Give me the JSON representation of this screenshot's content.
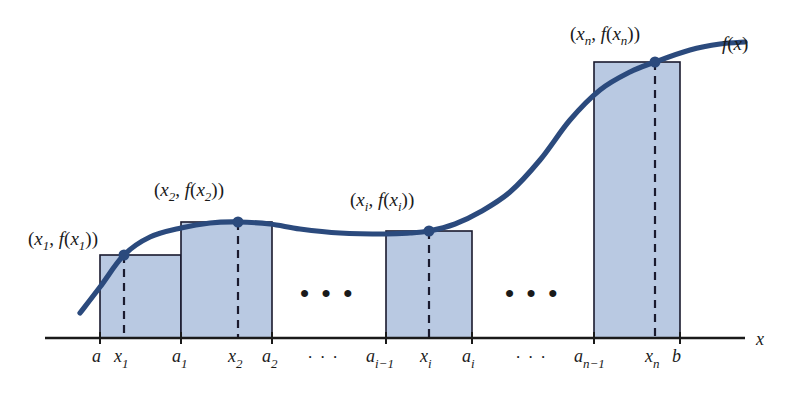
{
  "figure": {
    "colors": {
      "rect_fill": "#b9c9e2",
      "rect_stroke": "#1a1a2e",
      "curve": "#2b4a7d",
      "axis": "#1a1a1a",
      "dash": "#1a1a2e",
      "text": "#1a1a1a"
    }
  },
  "curve": {
    "label": "f(x)",
    "label_base": "f",
    "label_paren_open": "(",
    "label_var": "x",
    "label_paren_close": ")"
  },
  "axis": {
    "x_label": "x",
    "y_baseline": 338,
    "x_start": 45,
    "x_end": 745
  },
  "point_labels": [
    {
      "id": "p1",
      "text": "(x_1, f(x_1))",
      "open": "(",
      "var": "x",
      "sub": "1",
      "comma": ", ",
      "fn": "f",
      "x": 28,
      "y": 245
    },
    {
      "id": "p2",
      "text": "(x_2, f(x_2))",
      "open": "(",
      "var": "x",
      "sub": "2",
      "comma": ", ",
      "fn": "f",
      "x": 154,
      "y": 196
    },
    {
      "id": "pi",
      "text": "(x_i, f(x_i))",
      "open": "(",
      "var": "x",
      "sub": "i",
      "comma": ", ",
      "fn": "f",
      "x": 350,
      "y": 206
    },
    {
      "id": "pn",
      "text": "(x_n, f(x_n))",
      "open": "(",
      "var": "x",
      "sub": "n",
      "comma": ", ",
      "fn": "f",
      "x": 570,
      "y": 40
    }
  ],
  "axis_ticks": [
    {
      "id": "a",
      "main": "a",
      "sub": "",
      "x": 100,
      "label_x": 96,
      "label_y": 360
    },
    {
      "id": "x1",
      "main": "x",
      "sub": "1",
      "x": 124,
      "label_x": 118,
      "label_y": 360
    },
    {
      "id": "a1",
      "main": "a",
      "sub": "1",
      "x": 181,
      "label_x": 175,
      "label_y": 360
    },
    {
      "id": "x2",
      "main": "x",
      "sub": "2",
      "x": 238,
      "label_x": 232,
      "label_y": 360
    },
    {
      "id": "a2",
      "main": "a",
      "sub": "2",
      "x": 272,
      "label_x": 266,
      "label_y": 360
    },
    {
      "id": "ai-1",
      "main": "a",
      "sub": "i−1",
      "x": 386,
      "label_x": 370,
      "label_y": 360
    },
    {
      "id": "xi",
      "main": "x",
      "sub": "i",
      "x": 429,
      "label_x": 424,
      "label_y": 360
    },
    {
      "id": "ai",
      "main": "a",
      "sub": "i",
      "x": 472,
      "label_x": 466,
      "label_y": 360
    },
    {
      "id": "an-1",
      "main": "a",
      "sub": "n−1",
      "x": 594,
      "label_x": 578,
      "label_y": 360
    },
    {
      "id": "xn",
      "main": "x",
      "sub": "n",
      "x": 655,
      "label_x": 650,
      "label_y": 360
    },
    {
      "id": "b",
      "main": "b",
      "sub": "",
      "x": 680,
      "label_x": 676,
      "label_y": 360
    }
  ],
  "axis_ellipses": [
    {
      "id": "axis-ellipsis-left",
      "text": "...",
      "x": 312,
      "y": 358
    },
    {
      "id": "axis-ellipsis-right",
      "text": "...",
      "x": 520,
      "y": 358
    }
  ],
  "gap_ellipses": [
    {
      "id": "gap-ellipsis-left",
      "text": "• • •",
      "x": 303,
      "y": 302
    },
    {
      "id": "gap-ellipsis-right",
      "text": "• • •",
      "x": 508,
      "y": 302
    }
  ],
  "rectangles": [
    {
      "id": "rect-1",
      "left": 100,
      "right": 181,
      "top": 255,
      "bottom": 338,
      "midline_x": 124,
      "dot_x": 124,
      "dot_y": 255
    },
    {
      "id": "rect-2",
      "left": 181,
      "right": 272,
      "top": 222,
      "bottom": 338,
      "midline_x": 238,
      "dot_x": 238,
      "dot_y": 222
    },
    {
      "id": "rect-i",
      "left": 386,
      "right": 472,
      "top": 231,
      "bottom": 338,
      "midline_x": 429,
      "dot_x": 429,
      "dot_y": 231
    },
    {
      "id": "rect-n",
      "left": 594,
      "right": 680,
      "top": 62,
      "bottom": 338,
      "midline_x": 655,
      "dot_x": 655,
      "dot_y": 62
    }
  ],
  "chart_data": {
    "type": "area",
    "xlabel": "x",
    "ylabel": "",
    "categories": [
      "[a, a_1]",
      "[a_1, a_2]",
      "[a_{i-1}, a_i]",
      "[a_{n-1}, b]"
    ],
    "sample_points": [
      "x_1",
      "x_2",
      "x_i",
      "x_n"
    ],
    "rect_heights_px": [
      83,
      116,
      107,
      276
    ],
    "rect_left_px": [
      100,
      181,
      386,
      594
    ],
    "rect_right_px": [
      181,
      272,
      472,
      680
    ],
    "baseline_px": 338,
    "curve_points": [
      [
        80,
        313
      ],
      [
        100,
        287
      ],
      [
        124,
        255
      ],
      [
        150,
        237
      ],
      [
        181,
        228
      ],
      [
        210,
        223
      ],
      [
        238,
        222
      ],
      [
        270,
        224
      ],
      [
        300,
        229
      ],
      [
        340,
        233
      ],
      [
        386,
        234
      ],
      [
        410,
        233
      ],
      [
        429,
        231
      ],
      [
        455,
        224
      ],
      [
        480,
        212
      ],
      [
        510,
        192
      ],
      [
        540,
        160
      ],
      [
        570,
        120
      ],
      [
        600,
        90
      ],
      [
        630,
        72
      ],
      [
        655,
        62
      ],
      [
        690,
        50
      ],
      [
        720,
        44
      ],
      [
        745,
        42
      ]
    ],
    "legend": [
      "f(x)"
    ],
    "grid": false
  }
}
